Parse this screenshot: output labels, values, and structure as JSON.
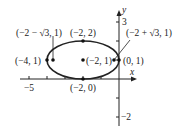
{
  "diagram": {
    "axes": {
      "x_label": "x",
      "y_label": "y",
      "x_tick_labels": [
        "−5"
      ],
      "y_tick_labels": [
        "3",
        "−2"
      ]
    },
    "ellipse": {
      "center": [
        -2,
        1
      ],
      "semi_x": 2,
      "semi_y": 1
    },
    "points": [
      {
        "label": "(−2 − √3, 1)",
        "x": -3.732,
        "y": 1
      },
      {
        "label": "(−2, 2)",
        "x": -2,
        "y": 2
      },
      {
        "label": "(−2 + √3, 1)",
        "x": -0.268,
        "y": 1
      },
      {
        "label": "(−4, 1)",
        "x": -4,
        "y": 1
      },
      {
        "label": "(−2, 1)",
        "x": -2,
        "y": 1
      },
      {
        "label": "(0, 1)",
        "x": 0,
        "y": 1
      },
      {
        "label": "(−2, 0)",
        "x": -2,
        "y": 0
      }
    ]
  }
}
